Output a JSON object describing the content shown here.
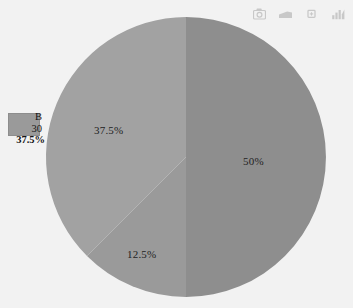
{
  "toolbar": {
    "icons": [
      {
        "name": "camera-icon",
        "title": "Download plot as a png"
      },
      {
        "name": "pan-icon",
        "title": "Pan"
      },
      {
        "name": "zoom-icon",
        "title": "Zoom"
      },
      {
        "name": "bar-chart-icon",
        "title": "Chart"
      }
    ]
  },
  "tooltip": {
    "series_name": "B",
    "value": "30",
    "percent": "37.5%",
    "swatch_color": "#9a9a9a"
  },
  "chart_data": {
    "type": "pie",
    "title": "",
    "categories": [
      "A",
      "B",
      "C"
    ],
    "values": [
      50,
      37.5,
      12.5
    ],
    "raw_values": [
      40,
      30,
      10
    ],
    "labels": [
      "50%",
      "37.5%",
      "12.5%"
    ],
    "colors": [
      "#8e8e8e",
      "#a2a2a2",
      "#9a9a9a"
    ],
    "legend": "none",
    "grid": false,
    "start_angle_deg": 0,
    "direction": "clockwise",
    "center": {
      "x": 186,
      "y": 157
    },
    "radius": 140,
    "background": "#f2f2f2",
    "slices": [
      {
        "label": "50%",
        "percent": 50,
        "value": 40,
        "color": "#8e8e8e",
        "start_deg": 0,
        "end_deg": 180
      },
      {
        "label": "12.5%",
        "percent": 12.5,
        "value": 10,
        "color": "#9a9a9a",
        "start_deg": 180,
        "end_deg": 225
      },
      {
        "label": "37.5%",
        "percent": 37.5,
        "value": 30,
        "color": "#a2a2a2",
        "start_deg": 225,
        "end_deg": 360
      }
    ]
  }
}
